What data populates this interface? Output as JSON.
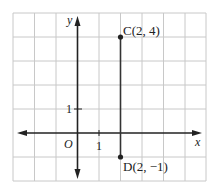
{
  "diagram": {
    "type": "coordinate-plane",
    "axes": {
      "x_label": "x",
      "y_label": "y",
      "origin_label": "O"
    },
    "ticks": {
      "x_unit_label": "1",
      "y_unit_label": "1"
    },
    "grid": {
      "x_range": [
        -3,
        6
      ],
      "y_range": [
        -2,
        5
      ]
    },
    "points": [
      {
        "name": "C",
        "label": "C(2, 4)",
        "x": 2,
        "y": 4
      },
      {
        "name": "D",
        "label": "D(2, −1)",
        "x": 2,
        "y": -1
      }
    ],
    "segments": [
      {
        "from": "C",
        "to": "D"
      }
    ],
    "colors": {
      "grid": "#c8c8c8",
      "axis": "#222222",
      "segment": "#333333"
    }
  }
}
